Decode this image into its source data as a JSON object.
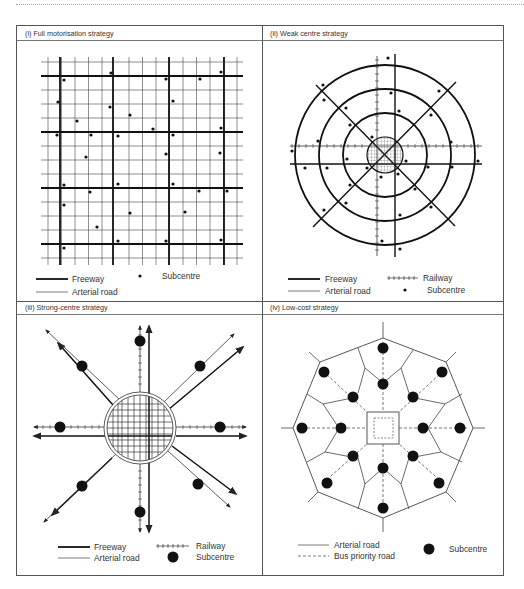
{
  "figure": {
    "panels": [
      {
        "id": "i",
        "title": "(i) Full motorisation strategy",
        "legend": {
          "freeway": "Freeway",
          "arterial": "Arterial road",
          "subcentre": "Subcentre"
        }
      },
      {
        "id": "ii",
        "title": "(ii) Weak centre strategy",
        "legend": {
          "freeway": "Freeway",
          "arterial": "Arterial road",
          "railway": "Railway",
          "subcentre": "Subcentre"
        }
      },
      {
        "id": "iii",
        "title": "(iii) Strong-centre strategy",
        "legend": {
          "freeway": "Freeway",
          "arterial": "Arterial road",
          "railway": "Railway",
          "subcentre": "Subcentre"
        }
      },
      {
        "id": "iv",
        "title": "(iv) Low-cost strategy",
        "legend": {
          "arterial": "Arterial road",
          "bus": "Bus priority road",
          "subcentre": "Subcentre"
        }
      }
    ],
    "colors": {
      "line": "#222222",
      "border": "#555555",
      "background": "#ffffff"
    }
  }
}
